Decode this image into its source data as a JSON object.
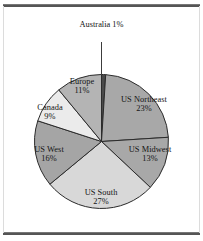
{
  "figure": {
    "background_color": "#ffffff",
    "rule_color": "#555555"
  },
  "chart_data": {
    "type": "pie",
    "title": "",
    "subtitle": "",
    "xlabel": "",
    "ylabel": "",
    "legend_position": "none",
    "labels_inside_slices": true,
    "start_angle_deg": 0,
    "direction": "clockwise",
    "units": "percent",
    "total": 100,
    "categories": [
      "Australia",
      "US Northeast",
      "US Midwest",
      "US South",
      "US West",
      "Canada",
      "Europe"
    ],
    "values": [
      1,
      23,
      13,
      27,
      16,
      9,
      11
    ],
    "value_labels": [
      "1%",
      "23%",
      "13%",
      "27%",
      "16%",
      "9%",
      "11%"
    ],
    "slice_colors": [
      "#4a4a4a",
      "#a8a8a8",
      "#a8a8a8",
      "#d8d8d8",
      "#a5a5a5",
      "#ebebeb",
      "#b4b4b4"
    ],
    "slice_edge_color": "#2b2b2b",
    "slices": [
      {
        "name": "Australia",
        "label": "Australia",
        "percent_label": "1%",
        "value": 1,
        "color": "#4a4a4a",
        "callout": true
      },
      {
        "name": "US Northeast",
        "label": "US Northeast",
        "percent_label": "23%",
        "value": 23,
        "color": "#a8a8a8",
        "callout": false
      },
      {
        "name": "US Midwest",
        "label": "US Midwest",
        "percent_label": "13%",
        "value": 13,
        "color": "#a8a8a8",
        "callout": false
      },
      {
        "name": "US South",
        "label": "US South",
        "percent_label": "27%",
        "value": 27,
        "color": "#d8d8d8",
        "callout": false
      },
      {
        "name": "US West",
        "label": "US West",
        "percent_label": "16%",
        "value": 16,
        "color": "#a5a5a5",
        "callout": false
      },
      {
        "name": "Canada",
        "label": "Canada",
        "percent_label": "9%",
        "value": 9,
        "color": "#ebebeb",
        "callout": false
      },
      {
        "name": "Europe",
        "label": "Europe",
        "percent_label": "11%",
        "value": 11,
        "color": "#b4b4b4",
        "callout": false
      }
    ]
  }
}
